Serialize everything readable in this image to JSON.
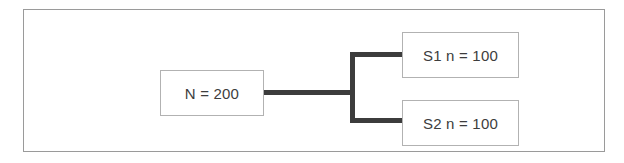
{
  "figure": {
    "type": "flow-diagram",
    "parent": {
      "label": "N = 200"
    },
    "children": [
      {
        "label": "S1 n = 100"
      },
      {
        "label": "S2 n = 100"
      }
    ],
    "colors": {
      "frame_border": "#9a9a9a",
      "box_border": "#b2b2b2",
      "box_fill": "#ffffff",
      "connector": "#3c3c3c",
      "text": "#3d3d3d",
      "background": "#ffffff"
    }
  }
}
